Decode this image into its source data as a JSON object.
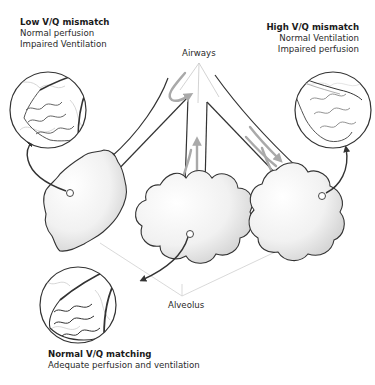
{
  "figure": {
    "callouts": {
      "airways": "Airways",
      "alveolus": "Alveolus"
    },
    "panels": [
      {
        "id": "low-vq",
        "title": "Low V/Q mismatch",
        "line1": "Normal perfusion",
        "line2": "Impaired Ventilation",
        "position": "top-left"
      },
      {
        "id": "high-vq",
        "title": "High V/Q mismatch",
        "line1": "Normal Ventilation",
        "line2": "Impaired perfusion",
        "position": "top-right"
      },
      {
        "id": "normal-vq",
        "title": "Normal V/Q matching",
        "line1": "Adequate perfusion and ventilation",
        "position": "bottom-left"
      }
    ],
    "colors": {
      "outline": "#333333",
      "airflow_arrow": "#a9a9a9",
      "vessel_light": "#c8c8c8",
      "alveolus_shade": "#e6e6e6",
      "guide_line": "#cfcfcf"
    }
  }
}
